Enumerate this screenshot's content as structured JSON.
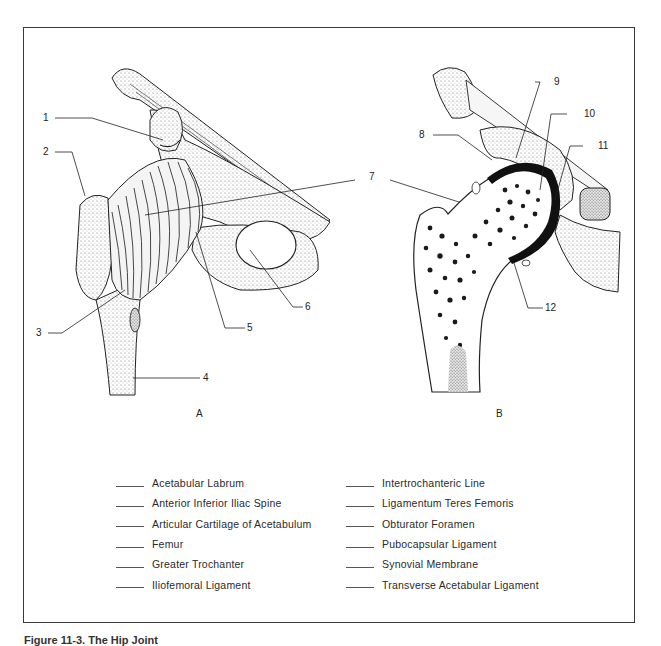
{
  "figure": {
    "caption": "Figure 11-3. The Hip Joint",
    "panels": [
      {
        "id": "A",
        "label": "A"
      },
      {
        "id": "B",
        "label": "B"
      }
    ],
    "callouts": [
      {
        "number": "1",
        "panel": "A"
      },
      {
        "number": "2",
        "panel": "A"
      },
      {
        "number": "3",
        "panel": "A"
      },
      {
        "number": "4",
        "panel": "A"
      },
      {
        "number": "5",
        "panel": "A"
      },
      {
        "number": "6",
        "panel": "A"
      },
      {
        "number": "7",
        "panel": "A/B"
      },
      {
        "number": "8",
        "panel": "B"
      },
      {
        "number": "9",
        "panel": "B"
      },
      {
        "number": "10",
        "panel": "B"
      },
      {
        "number": "11",
        "panel": "B"
      },
      {
        "number": "12",
        "panel": "B"
      }
    ]
  },
  "legend": {
    "left_column": [
      "Acetabular Labrum",
      "Anterior Inferior Iliac Spine",
      "Articular Cartilage of Acetabulum",
      "Femur",
      "Greater Trochanter",
      "Iliofemoral Ligament"
    ],
    "right_column": [
      "Intertrochanteric Line",
      "Ligamentum Teres Femoris",
      "Obturator Foramen",
      "Pubocapsular Ligament",
      "Synovial Membrane",
      "Transverse Acetabular Ligament"
    ]
  },
  "colors": {
    "ink": "#1a1a1a",
    "frame": "#3a3a3a",
    "stipple": "#8a8a8a",
    "background": "#ffffff"
  }
}
